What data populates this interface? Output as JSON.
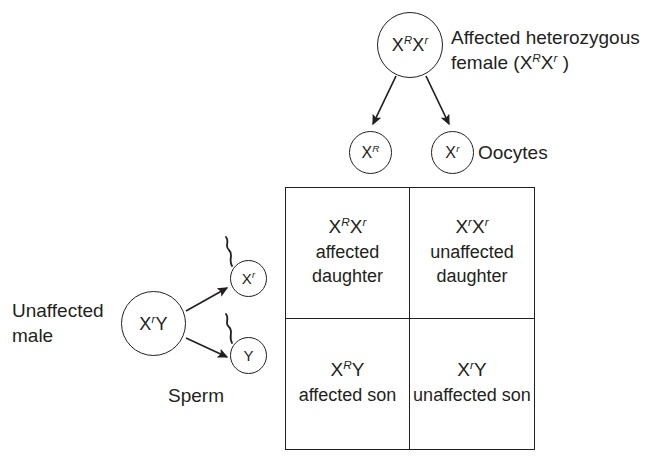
{
  "diagram": {
    "line_color": "#231f20",
    "background": "#ffffff"
  },
  "mother": {
    "circle_genotype_html": "X<sup>R</sup>X<sup>r</sup>",
    "label_html": "Affected heterozygous<br>female (X<sup>R</sup>X<sup>r</sup> )",
    "label_plain": "Affected heterozygous female (XRXr )"
  },
  "oocytes": {
    "label": "Oocytes",
    "gametes": [
      {
        "name": "oocyte-x-dominant",
        "genotype_html": "X<sup>R</sup>",
        "genotype_plain": "XR"
      },
      {
        "name": "oocyte-x-recessive",
        "genotype_html": "X<sup>r</sup>",
        "genotype_plain": "Xr"
      }
    ]
  },
  "father": {
    "circle_genotype_html": "X<sup>r</sup>Y",
    "circle_genotype_plain": "XrY",
    "label": "Unaffected\nmale"
  },
  "sperm": {
    "label": "Sperm",
    "gametes": [
      {
        "name": "sperm-x-recessive",
        "genotype_html": "X<sup>r</sup>",
        "genotype_plain": "Xr"
      },
      {
        "name": "sperm-y",
        "genotype_html": "Y",
        "genotype_plain": "Y"
      }
    ]
  },
  "punnett": {
    "cells": [
      {
        "position": "top-left",
        "genotype_html": "X<sup>R</sup>X<sup>r</sup>",
        "genotype_plain": "XRXr",
        "description": "affected\ndaughter"
      },
      {
        "position": "top-right",
        "genotype_html": "X<sup>r</sup>X<sup>r</sup>",
        "genotype_plain": "XrXr",
        "description": "unaffected\ndaughter"
      },
      {
        "position": "bottom-left",
        "genotype_html": "X<sup>R</sup>Y",
        "genotype_plain": "XRY",
        "description": "affected\nson"
      },
      {
        "position": "bottom-right",
        "genotype_html": "X<sup>r</sup>Y",
        "genotype_plain": "XrY",
        "description": "unaffected\nson"
      }
    ]
  }
}
